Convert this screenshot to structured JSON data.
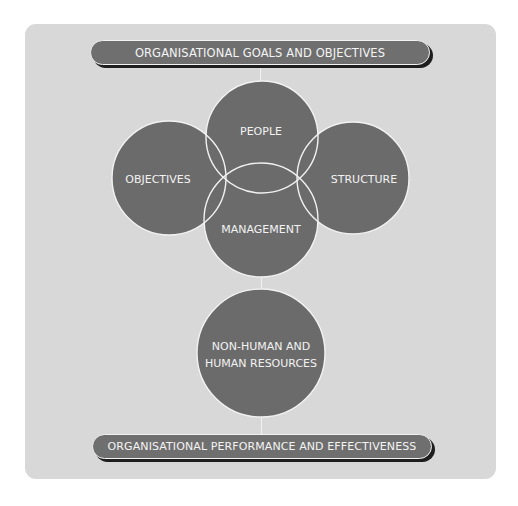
{
  "diagram": {
    "top_banner": "ORGANISATIONAL GOALS AND OBJECTIVES",
    "bottom_banner": "ORGANISATIONAL PERFORMANCE AND EFFECTIVENESS",
    "circles": {
      "people": "PEOPLE",
      "objectives": "OBJECTIVES",
      "structure": "STRUCTURE",
      "management": "MANAGEMENT",
      "resources_line1": "NON-HUMAN AND",
      "resources_line2": "HUMAN RESOURCES"
    },
    "colors": {
      "panel": "#d8d8d8",
      "circle_fill": "#6b6b6b",
      "outline": "#f2f2f2",
      "shadow": "#1e1e1e"
    }
  }
}
